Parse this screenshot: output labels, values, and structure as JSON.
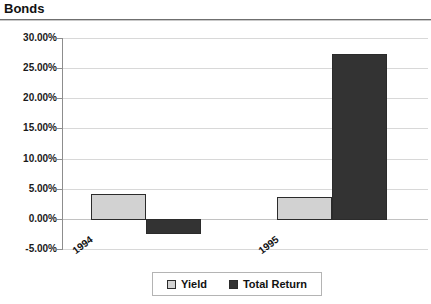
{
  "header": {
    "title": "Bonds"
  },
  "chart_data": {
    "type": "bar",
    "title": "Bonds",
    "xlabel": "",
    "ylabel": "",
    "categories": [
      "1994",
      "1995"
    ],
    "series": [
      {
        "name": "Yield",
        "values": [
          4.2,
          3.7
        ],
        "color": "#d2d2d2"
      },
      {
        "name": "Total Return",
        "values": [
          -2.3,
          27.3
        ],
        "color": "#333333"
      }
    ],
    "ylim": [
      -5,
      30
    ],
    "ytick_step": 5,
    "ytick_labels": [
      "30.00%",
      "25.00%",
      "20.00%",
      "15.00%",
      "10.00%",
      "5.00%",
      "0.00%",
      "-5.00%"
    ],
    "ytick_values": [
      30,
      25,
      20,
      15,
      10,
      5,
      0,
      -5
    ],
    "grid": true,
    "legend_position": "bottom",
    "value_format": "percent"
  },
  "legend": {
    "items": [
      {
        "label": "Yield",
        "swatch": "yield"
      },
      {
        "label": "Total Return",
        "swatch": "total"
      }
    ]
  }
}
